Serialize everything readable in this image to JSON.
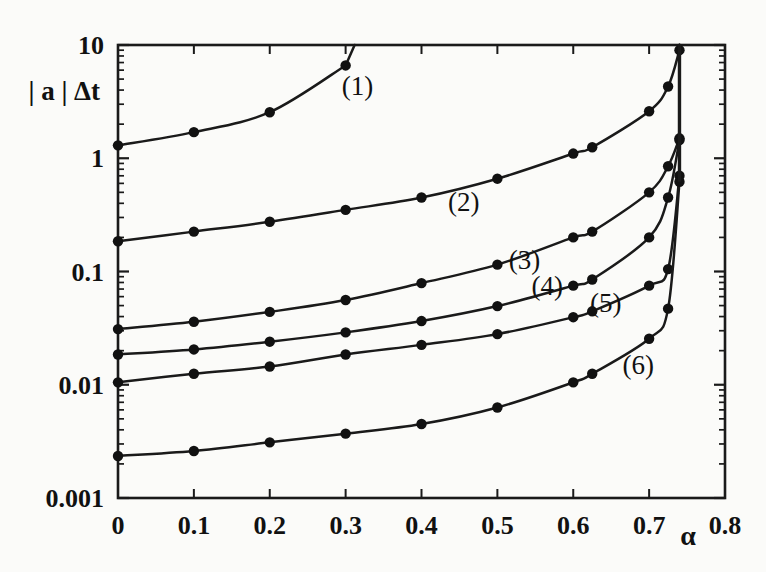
{
  "chart_data": {
    "type": "line",
    "title": "",
    "xlabel": "α",
    "ylabel": "| a | Δt",
    "xlim": [
      0,
      0.8
    ],
    "ylim": [
      0.001,
      10
    ],
    "yscale": "log",
    "xscale": "linear",
    "grid": false,
    "legend_position": "inline-curve-labels",
    "xticks": [
      "0",
      "0.1",
      "0.2",
      "0.3",
      "0.4",
      "0.5",
      "0.6",
      "0.7",
      "0.8"
    ],
    "xtick_values": [
      0,
      0.1,
      0.2,
      0.3,
      0.4,
      0.5,
      0.6,
      0.7,
      0.8
    ],
    "yticks": [
      "10",
      "1",
      "0.1",
      "0.01",
      "0.001"
    ],
    "ytick_values": [
      10,
      1,
      0.1,
      0.01,
      0.001
    ],
    "asymptote_alpha": 0.74,
    "series": [
      {
        "name": "(1)",
        "label": "(1)",
        "label_x": 0.295,
        "label_y": 3.6,
        "x": [
          0,
          0.1,
          0.2,
          0.3
        ],
        "y": [
          1.3,
          1.7,
          2.55,
          6.6
        ]
      },
      {
        "name": "(2)",
        "label": "(2)",
        "label_x": 0.435,
        "label_y": 0.34,
        "x": [
          0,
          0.1,
          0.2,
          0.3,
          0.4,
          0.5,
          0.6,
          0.625,
          0.7,
          0.725,
          0.74
        ],
        "y": [
          0.185,
          0.225,
          0.275,
          0.35,
          0.45,
          0.66,
          1.1,
          1.25,
          2.6,
          4.3,
          9.0
        ]
      },
      {
        "name": "(3)",
        "label": "(3)",
        "label_x": 0.515,
        "label_y": 0.105,
        "x": [
          0,
          0.1,
          0.2,
          0.3,
          0.4,
          0.5,
          0.6,
          0.625,
          0.7,
          0.725,
          0.74
        ],
        "y": [
          0.031,
          0.036,
          0.044,
          0.056,
          0.079,
          0.115,
          0.2,
          0.225,
          0.5,
          0.85,
          1.5
        ]
      },
      {
        "name": "(4)",
        "label": "(4)",
        "label_x": 0.545,
        "label_y": 0.062,
        "x": [
          0,
          0.1,
          0.2,
          0.3,
          0.4,
          0.5,
          0.6,
          0.625,
          0.7,
          0.725,
          0.74
        ],
        "y": [
          0.0185,
          0.0205,
          0.024,
          0.029,
          0.0365,
          0.0495,
          0.075,
          0.085,
          0.2,
          0.45,
          1.45
        ]
      },
      {
        "name": "(5)",
        "label": "(5)",
        "label_x": 0.622,
        "label_y": 0.044,
        "x": [
          0,
          0.1,
          0.2,
          0.3,
          0.4,
          0.5,
          0.6,
          0.625,
          0.7,
          0.725,
          0.74
        ],
        "y": [
          0.0105,
          0.0125,
          0.0145,
          0.0185,
          0.0225,
          0.028,
          0.0395,
          0.0445,
          0.075,
          0.105,
          0.7
        ]
      },
      {
        "name": "(6)",
        "label": "(6)",
        "label_x": 0.665,
        "label_y": 0.0125,
        "x": [
          0,
          0.1,
          0.2,
          0.3,
          0.4,
          0.5,
          0.6,
          0.625,
          0.7,
          0.725,
          0.74
        ],
        "y": [
          0.00235,
          0.0026,
          0.0031,
          0.0037,
          0.0045,
          0.0063,
          0.0105,
          0.0125,
          0.0255,
          0.047,
          0.62
        ]
      }
    ]
  },
  "style": {
    "line_color": "#1a1a1a",
    "marker_color": "#111111",
    "axis_color": "#1a1a1a",
    "text_color": "#111111",
    "background": "#fbfbf9"
  }
}
